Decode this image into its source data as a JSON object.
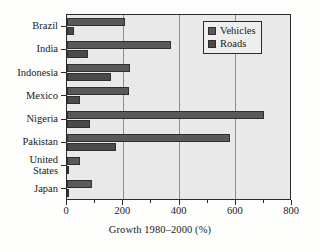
{
  "chart_data": {
    "type": "bar",
    "orientation": "horizontal",
    "title": "",
    "xlabel": "Growth 1980–2000 (%)",
    "ylabel": "",
    "xlim": [
      0,
      800
    ],
    "xticks": [
      0,
      200,
      400,
      600,
      800
    ],
    "xticklabels": [
      "0",
      "200",
      "400",
      "600",
      "800"
    ],
    "grid": "vertical",
    "legend_position": "top-right",
    "categories": [
      "Brazil",
      "India",
      "Indonesia",
      "Mexico",
      "Nigeria",
      "Pakistan",
      "United States",
      "Japan"
    ],
    "series": [
      {
        "name": "Vehicles",
        "color": "#595959",
        "values": [
          205,
          370,
          225,
          220,
          700,
          580,
          45,
          88
        ]
      },
      {
        "name": "Roads",
        "color": "#4a4a4a",
        "values": [
          25,
          75,
          155,
          45,
          82,
          175,
          4,
          6
        ]
      }
    ]
  },
  "legend": {
    "items": [
      {
        "label": "Vehicles"
      },
      {
        "label": "Roads"
      }
    ]
  },
  "axis": {
    "x_title": "Growth 1980–2000 (%)",
    "ticklabels": [
      "0",
      "200",
      "400",
      "600",
      "800"
    ]
  },
  "categories": [
    {
      "label": "Brazil"
    },
    {
      "label": "India"
    },
    {
      "label": "Indonesia"
    },
    {
      "label": "Mexico"
    },
    {
      "label": "Nigeria"
    },
    {
      "label": "Pakistan"
    },
    {
      "label": "United\nStates"
    },
    {
      "label": "Japan"
    }
  ],
  "colors": {
    "vehicles": "#595959",
    "roads": "#4a4a4a",
    "plot_background": "#e9e9e9",
    "axis": "#2b2b2b",
    "gridline": "#8e8e8e"
  }
}
